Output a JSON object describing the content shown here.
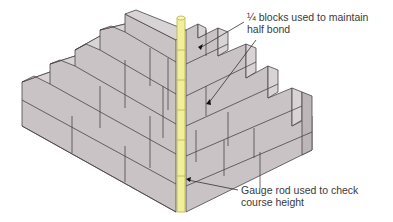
{
  "diagram": {
    "colors": {
      "block_front": "#c9c3c5",
      "block_top": "#d8d3d4",
      "block_side": "#bdb6b8",
      "outline": "#4a4446",
      "gauge_rod": "#f2ef9a",
      "gauge_rod_edge": "#b8b24a",
      "leader_line": "#333333"
    },
    "annotations": [
      {
        "id": "quarter-blocks",
        "lines": [
          "¼  blocks used to maintain",
          "half bond"
        ]
      },
      {
        "id": "gauge-rod",
        "lines": [
          "Gauge rod used to check",
          "course height"
        ]
      }
    ]
  }
}
